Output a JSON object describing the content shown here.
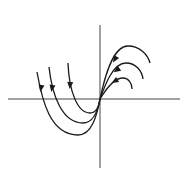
{
  "diagram": {
    "type": "phase-portrait",
    "colors": {
      "stroke": "#1a1a1a",
      "axis": "#444444",
      "background": "#ffffff"
    },
    "axes": {
      "horizontal": {
        "x1": 8,
        "y1": 99,
        "x2": 180,
        "y2": 99
      },
      "vertical": {
        "x1": 100,
        "y1": 25,
        "x2": 100,
        "y2": 168
      }
    },
    "trajectories": [
      {
        "id": "left-outer",
        "path": "M37,72 C42,100 50,135 78,135 C92,135 97,115 100,99",
        "arrow": {
          "x": 41,
          "y": 88,
          "angle": 100
        }
      },
      {
        "id": "left-middle",
        "path": "M49,67 C52,95 62,123 83,123 C94,123 98,110 100,99",
        "arrow": {
          "x": 52,
          "y": 88,
          "angle": 100
        }
      },
      {
        "id": "left-inner",
        "path": "M68,63 C69,90 77,113 90,113 C96,113 99,106 100,99",
        "arrow": {
          "x": 70,
          "y": 85,
          "angle": 95
        }
      },
      {
        "id": "right-outer",
        "path": "M100,99 C104,80 112,46 128,46 C140,46 148,55 150,63",
        "arrow": {
          "x": 115,
          "y": 59,
          "angle": 120
        }
      },
      {
        "id": "right-middle",
        "path": "M100,99 C105,85 113,63 126,63 C136,63 142,71 143,79",
        "arrow": {
          "x": 117,
          "y": 70,
          "angle": 145
        }
      },
      {
        "id": "right-inner",
        "path": "M100,99 C106,89 114,78 123,78 C129,78 132,84 132,89",
        "arrow": {
          "x": 115,
          "y": 81,
          "angle": 150
        }
      }
    ]
  }
}
